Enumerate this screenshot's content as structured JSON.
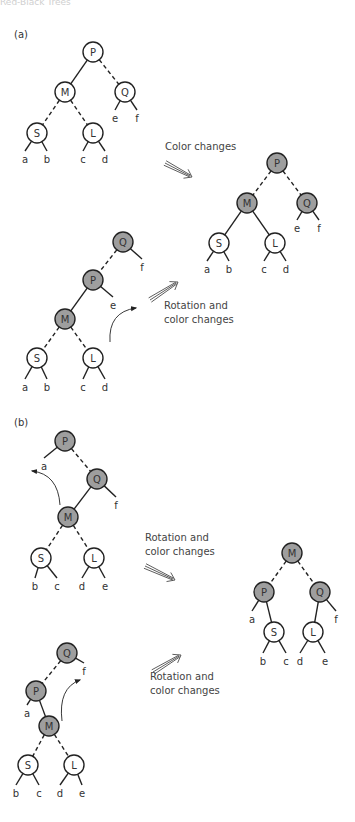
{
  "header": {
    "text": "Red-Black Trees"
  },
  "colors": {
    "red_node_fill": "#ffffff",
    "black_node_fill": "#9e9e9e",
    "stroke": "#222222",
    "text": "#333333"
  },
  "node_radius": 10,
  "panels": [
    {
      "label": "(a)",
      "x": 14,
      "y": 38
    },
    {
      "label": "(b)",
      "x": 14,
      "y": 426
    }
  ],
  "captions": [
    {
      "lines": [
        "Color changes"
      ],
      "x": 165,
      "y": 150
    },
    {
      "lines": [
        "Rotation and",
        "color changes"
      ],
      "x": 164,
      "y": 309
    },
    {
      "lines": [
        "Rotation and",
        "color changes"
      ],
      "x": 145,
      "y": 541
    },
    {
      "lines": [
        "Rotation and",
        "color changes"
      ],
      "x": 150,
      "y": 680
    }
  ],
  "double_arrows": [
    {
      "x1": 165,
      "y1": 163,
      "x2": 192,
      "y2": 177
    },
    {
      "x1": 150,
      "y1": 300,
      "x2": 178,
      "y2": 282
    },
    {
      "x1": 145,
      "y1": 566,
      "x2": 175,
      "y2": 580
    },
    {
      "x1": 153,
      "y1": 672,
      "x2": 181,
      "y2": 655
    }
  ],
  "curved_arrows": [
    {
      "from": [
        110,
        342
      ],
      "ctrl": [
        108,
        312
      ],
      "to": [
        136,
        308
      ]
    },
    {
      "from": [
        60,
        505
      ],
      "ctrl": [
        58,
        474
      ],
      "to": [
        32,
        471
      ]
    },
    {
      "from": [
        62,
        721
      ],
      "ctrl": [
        58,
        688
      ],
      "to": [
        80,
        680
      ]
    }
  ],
  "trees": [
    {
      "name": "a-before-color-change",
      "nodes": [
        {
          "id": "P",
          "x": 93,
          "y": 52,
          "black": false
        },
        {
          "id": "M",
          "x": 65,
          "y": 92,
          "black": false
        },
        {
          "id": "Q",
          "x": 125,
          "y": 92,
          "black": false
        },
        {
          "id": "S",
          "x": 37,
          "y": 133,
          "black": false
        },
        {
          "id": "L",
          "x": 93,
          "y": 133,
          "black": false
        }
      ],
      "edges": [
        {
          "from": "P",
          "to": "M",
          "dashed": false
        },
        {
          "from": "P",
          "to": "Q",
          "dashed": true
        },
        {
          "from": "M",
          "to": "S",
          "dashed": true
        },
        {
          "from": "M",
          "to": "L",
          "dashed": true
        }
      ],
      "leaves": [
        {
          "label": "a",
          "parent": "S",
          "x": 25,
          "y": 158
        },
        {
          "label": "b",
          "parent": "S",
          "x": 47,
          "y": 158
        },
        {
          "label": "c",
          "parent": "L",
          "x": 83,
          "y": 158
        },
        {
          "label": "d",
          "parent": "L",
          "x": 105,
          "y": 158
        },
        {
          "label": "e",
          "parent": "Q",
          "x": 115,
          "y": 117
        },
        {
          "label": "f",
          "parent": "Q",
          "x": 137,
          "y": 117
        }
      ]
    },
    {
      "name": "a-result",
      "nodes": [
        {
          "id": "P",
          "x": 277,
          "y": 163,
          "black": true
        },
        {
          "id": "M",
          "x": 247,
          "y": 203,
          "black": true
        },
        {
          "id": "Q",
          "x": 307,
          "y": 203,
          "black": true
        },
        {
          "id": "S",
          "x": 219,
          "y": 243,
          "black": false
        },
        {
          "id": "L",
          "x": 275,
          "y": 243,
          "black": false
        }
      ],
      "edges": [
        {
          "from": "P",
          "to": "M",
          "dashed": true
        },
        {
          "from": "P",
          "to": "Q",
          "dashed": true
        },
        {
          "from": "M",
          "to": "S",
          "dashed": false
        },
        {
          "from": "M",
          "to": "L",
          "dashed": false
        }
      ],
      "leaves": [
        {
          "label": "a",
          "parent": "S",
          "x": 207,
          "y": 268
        },
        {
          "label": "b",
          "parent": "S",
          "x": 229,
          "y": 268
        },
        {
          "label": "c",
          "parent": "L",
          "x": 264,
          "y": 268
        },
        {
          "label": "d",
          "parent": "L",
          "x": 286,
          "y": 268
        },
        {
          "label": "e",
          "parent": "Q",
          "x": 297,
          "y": 227
        },
        {
          "label": "f",
          "parent": "Q",
          "x": 319,
          "y": 227
        }
      ]
    },
    {
      "name": "a-before-rotation",
      "nodes": [
        {
          "id": "Q",
          "x": 123,
          "y": 242,
          "black": true
        },
        {
          "id": "P",
          "x": 93,
          "y": 280,
          "black": true
        },
        {
          "id": "M",
          "x": 65,
          "y": 319,
          "black": true
        },
        {
          "id": "S",
          "x": 37,
          "y": 358,
          "black": false
        },
        {
          "id": "L",
          "x": 93,
          "y": 358,
          "black": false
        }
      ],
      "edges": [
        {
          "from": "Q",
          "to": "P",
          "dashed": true
        },
        {
          "from": "P",
          "to": "M",
          "dashed": false
        },
        {
          "from": "M",
          "to": "S",
          "dashed": true
        },
        {
          "from": "M",
          "to": "L",
          "dashed": true
        }
      ],
      "leaves": [
        {
          "label": "f",
          "parent": "Q",
          "x": 142,
          "y": 266
        },
        {
          "label": "e",
          "parent": "P",
          "x": 113,
          "y": 304
        },
        {
          "label": "a",
          "parent": "S",
          "x": 25,
          "y": 386
        },
        {
          "label": "b",
          "parent": "S",
          "x": 47,
          "y": 386
        },
        {
          "label": "c",
          "parent": "L",
          "x": 83,
          "y": 386
        },
        {
          "label": "d",
          "parent": "L",
          "x": 105,
          "y": 386
        }
      ]
    },
    {
      "name": "b-before-rotation-1",
      "nodes": [
        {
          "id": "P",
          "x": 65,
          "y": 441,
          "black": true
        },
        {
          "id": "Q",
          "x": 97,
          "y": 479,
          "black": true
        },
        {
          "id": "M",
          "x": 68,
          "y": 517,
          "black": true
        },
        {
          "id": "S",
          "x": 41,
          "y": 558,
          "black": false
        },
        {
          "id": "L",
          "x": 94,
          "y": 558,
          "black": false
        }
      ],
      "edges": [
        {
          "from": "P",
          "to": "Q",
          "dashed": true
        },
        {
          "from": "Q",
          "to": "M",
          "dashed": false
        },
        {
          "from": "M",
          "to": "S",
          "dashed": true
        },
        {
          "from": "M",
          "to": "L",
          "dashed": true
        }
      ],
      "leaves": [
        {
          "label": "a",
          "parent": "P",
          "x": 44,
          "y": 465
        },
        {
          "label": "f",
          "parent": "Q",
          "x": 116,
          "y": 504
        },
        {
          "label": "b",
          "parent": "S",
          "x": 35,
          "y": 585
        },
        {
          "label": "c",
          "parent": "S",
          "x": 57,
          "y": 585
        },
        {
          "label": "d",
          "parent": "L",
          "x": 82,
          "y": 585
        },
        {
          "label": "e",
          "parent": "L",
          "x": 105,
          "y": 585
        }
      ]
    },
    {
      "name": "b-result",
      "nodes": [
        {
          "id": "M",
          "x": 292,
          "y": 553,
          "black": true
        },
        {
          "id": "P",
          "x": 264,
          "y": 592,
          "black": true
        },
        {
          "id": "Q",
          "x": 320,
          "y": 592,
          "black": true
        },
        {
          "id": "S",
          "x": 274,
          "y": 632,
          "black": false
        },
        {
          "id": "L",
          "x": 313,
          "y": 632,
          "black": false
        }
      ],
      "edges": [
        {
          "from": "M",
          "to": "P",
          "dashed": true
        },
        {
          "from": "M",
          "to": "Q",
          "dashed": true
        },
        {
          "from": "P",
          "to": "S",
          "dashed": false
        },
        {
          "from": "Q",
          "to": "L",
          "dashed": false
        }
      ],
      "leaves": [
        {
          "label": "a",
          "parent": "P",
          "x": 252,
          "y": 618
        },
        {
          "label": "f",
          "parent": "Q",
          "x": 336,
          "y": 618
        },
        {
          "label": "b",
          "parent": "S",
          "x": 263,
          "y": 660
        },
        {
          "label": "c",
          "parent": "S",
          "x": 286,
          "y": 660
        },
        {
          "label": "d",
          "parent": "L",
          "x": 300,
          "y": 660
        },
        {
          "label": "e",
          "parent": "L",
          "x": 325,
          "y": 660
        }
      ]
    },
    {
      "name": "b-before-rotation-2",
      "nodes": [
        {
          "id": "Q",
          "x": 67,
          "y": 653,
          "black": true
        },
        {
          "id": "P",
          "x": 36,
          "y": 691,
          "black": true
        },
        {
          "id": "M",
          "x": 49,
          "y": 726,
          "black": true
        },
        {
          "id": "S",
          "x": 28,
          "y": 765,
          "black": false
        },
        {
          "id": "L",
          "x": 74,
          "y": 765,
          "black": false
        }
      ],
      "edges": [
        {
          "from": "Q",
          "to": "P",
          "dashed": true
        },
        {
          "from": "P",
          "to": "M",
          "dashed": false
        },
        {
          "from": "M",
          "to": "S",
          "dashed": true
        },
        {
          "from": "M",
          "to": "L",
          "dashed": true
        }
      ],
      "leaves": [
        {
          "label": "f",
          "parent": "Q",
          "x": 84,
          "y": 670
        },
        {
          "label": "a",
          "parent": "P",
          "x": 27,
          "y": 712
        },
        {
          "label": "b",
          "parent": "S",
          "x": 16,
          "y": 792
        },
        {
          "label": "c",
          "parent": "S",
          "x": 39,
          "y": 792
        },
        {
          "label": "d",
          "parent": "L",
          "x": 60,
          "y": 792
        },
        {
          "label": "e",
          "parent": "L",
          "x": 82,
          "y": 792
        }
      ]
    }
  ]
}
